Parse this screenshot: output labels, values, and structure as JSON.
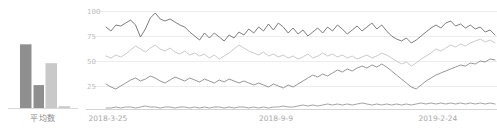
{
  "bar_chart": {
    "category_label": "平均数",
    "colors": {
      "dark": "#8f8f8f",
      "light": "#c9c9c9",
      "axis": "#d8d8d8"
    }
  },
  "line_chart": {
    "y_ticks": [
      "100",
      "75",
      "50",
      "25"
    ],
    "x_ticks": [
      "2018-3-25",
      "2018-9-9",
      "2019-2-24"
    ],
    "colors": {
      "series1": "#6e6e6e",
      "series2": "#c4c4c4",
      "series3": "#8a8a8a",
      "series4": "#9a9a9a",
      "grid": "#ededed",
      "tick": "#bcbcbc"
    }
  },
  "chart_data": [
    {
      "type": "bar",
      "title": "",
      "xlabel": "平均数",
      "ylabel": "",
      "categories": [
        "A",
        "B",
        "C",
        "D"
      ],
      "values": [
        85,
        31,
        60,
        3
      ],
      "ylim": [
        0,
        100
      ],
      "grid": false,
      "legend": "none",
      "colors": [
        "#8f8f8f",
        "#8f8f8f",
        "#c9c9c9",
        "#c9c9c9"
      ]
    },
    {
      "type": "line",
      "title": "",
      "xlabel": "",
      "ylabel": "",
      "ylim": [
        0,
        110
      ],
      "yticks": [
        100,
        75,
        50,
        25
      ],
      "grid": true,
      "legend": "none",
      "x": [
        "2018-3-25",
        "2018-9-9",
        "2019-2-24"
      ],
      "series": [
        {
          "name": "series1",
          "color": "#6e6e6e",
          "values": [
            84,
            80,
            86,
            85,
            88,
            91,
            86,
            74,
            82,
            93,
            98,
            92,
            90,
            92,
            89,
            86,
            84,
            79,
            75,
            71,
            78,
            73,
            78,
            74,
            70,
            76,
            73,
            79,
            76,
            82,
            78,
            84,
            80,
            87,
            81,
            88,
            84,
            78,
            83,
            77,
            81,
            75,
            79,
            83,
            78,
            84,
            80,
            86,
            82,
            77,
            81,
            85,
            80,
            84,
            88,
            82,
            86,
            80,
            75,
            72,
            70,
            73,
            68,
            71,
            75,
            79,
            83,
            86,
            83,
            88,
            90,
            85,
            87,
            83,
            86,
            82,
            84,
            79,
            81,
            76
          ]
        },
        {
          "name": "series2",
          "color": "#c4c4c4",
          "values": [
            55,
            53,
            56,
            54,
            57,
            61,
            65,
            62,
            59,
            63,
            66,
            62,
            60,
            63,
            59,
            57,
            60,
            56,
            58,
            55,
            57,
            53,
            56,
            52,
            55,
            58,
            62,
            66,
            63,
            60,
            58,
            56,
            59,
            55,
            57,
            54,
            56,
            53,
            55,
            52,
            54,
            57,
            53,
            55,
            58,
            55,
            57,
            54,
            56,
            53,
            55,
            52,
            54,
            56,
            53,
            55,
            58,
            56,
            53,
            50,
            47,
            49,
            45,
            48,
            52,
            55,
            58,
            62,
            60,
            63,
            66,
            64,
            67,
            65,
            68,
            70,
            72,
            69,
            71,
            68
          ]
        },
        {
          "name": "series3",
          "color": "#8a8a8a",
          "values": [
            27,
            24,
            22,
            25,
            28,
            31,
            33,
            30,
            32,
            35,
            33,
            30,
            28,
            31,
            34,
            32,
            30,
            33,
            31,
            29,
            32,
            30,
            28,
            31,
            29,
            32,
            30,
            28,
            30,
            28,
            26,
            28,
            26,
            24,
            27,
            25,
            23,
            26,
            24,
            27,
            30,
            33,
            36,
            34,
            37,
            35,
            38,
            41,
            39,
            42,
            40,
            43,
            45,
            43,
            46,
            44,
            47,
            44,
            40,
            36,
            32,
            28,
            24,
            22,
            26,
            30,
            33,
            36,
            38,
            40,
            42,
            44,
            46,
            45,
            48,
            47,
            50,
            49,
            52,
            51
          ]
        },
        {
          "name": "series4",
          "color": "#9a9a9a",
          "values": [
            3,
            3,
            4,
            3,
            4,
            4,
            3,
            4,
            5,
            4,
            4,
            3,
            4,
            4,
            3,
            4,
            4,
            3,
            4,
            3,
            4,
            3,
            4,
            4,
            3,
            4,
            3,
            4,
            4,
            3,
            4,
            3,
            4,
            3,
            4,
            4,
            5,
            4,
            4,
            5,
            6,
            5,
            6,
            5,
            6,
            7,
            6,
            7,
            6,
            7,
            6,
            7,
            8,
            7,
            6,
            7,
            6,
            7,
            6,
            7,
            6,
            7,
            6,
            7,
            8,
            7,
            8,
            7,
            8,
            7,
            8,
            7,
            8,
            7,
            8,
            7,
            8,
            7,
            8,
            7
          ]
        }
      ]
    }
  ]
}
